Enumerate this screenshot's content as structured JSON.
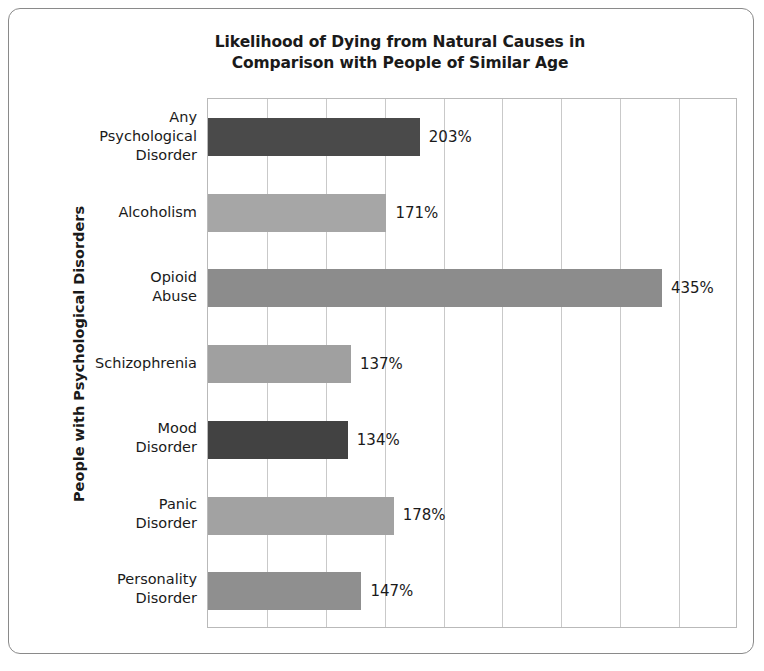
{
  "chart_data": {
    "type": "bar",
    "orientation": "horizontal",
    "title": "Likelihood of Dying from Natural Causes in Comparison with People of Similar Age",
    "title_lines": [
      "Likelihood of Dying from Natural Causes in",
      "Comparison with People of Similar Age"
    ],
    "xlabel": "",
    "ylabel": "People with Psychological Disorders",
    "categories": [
      "Any Psychological Disorder",
      "Alcoholism",
      "Opioid Abuse",
      "Schizophrenia",
      "Mood Disorder",
      "Panic Disorder",
      "Personality Disorder"
    ],
    "category_lines": [
      [
        "Any",
        "Psychological",
        "Disorder"
      ],
      [
        "Alcoholism"
      ],
      [
        "Opioid",
        "Abuse"
      ],
      [
        "Schizophrenia"
      ],
      [
        "Mood",
        "Disorder"
      ],
      [
        "Panic",
        "Disorder"
      ],
      [
        "Personality",
        "Disorder"
      ]
    ],
    "values": [
      203,
      171,
      435,
      137,
      134,
      178,
      147
    ],
    "value_labels": [
      "203%",
      "171%",
      "435%",
      "137%",
      "134%",
      "178%",
      "147%"
    ],
    "bar_colors": [
      "#4a4a4a",
      "#a6a6a6",
      "#8c8c8c",
      "#a0a0a0",
      "#424242",
      "#a2a2a2",
      "#8f8f8f"
    ],
    "unit": "%",
    "xlim": [
      0,
      506
    ],
    "grid": true,
    "gridlines_count": 8,
    "legend": "none",
    "tick_labels_x": [],
    "axis_frame_color": "#b9b9b9",
    "gridline_color": "#c9c9c9",
    "text_color": "#1a1a1a",
    "background": "#ffffff",
    "border_color": "#8a8a8a"
  }
}
